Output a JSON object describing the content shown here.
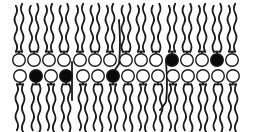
{
  "diagram": {
    "type": "lipid-bilayer",
    "colors": {
      "background": "#ffffff",
      "stroke": "#1a1a1a",
      "head_open": "#ffffff",
      "head_filled": "#0a0a0a"
    },
    "head_radius": 6.3,
    "upper_leaflet": {
      "head_y": 60,
      "tail_direction": "up",
      "tail_length": 50,
      "heads": [
        {
          "x": 19,
          "filled": false
        },
        {
          "x": 34,
          "filled": false
        },
        {
          "x": 49,
          "filled": false
        },
        {
          "x": 64,
          "filled": false
        },
        {
          "x": 80,
          "filled": false
        },
        {
          "x": 95,
          "filled": false
        },
        {
          "x": 110,
          "filled": false
        },
        {
          "x": 126,
          "filled": false
        },
        {
          "x": 141,
          "filled": false
        },
        {
          "x": 156,
          "filled": false
        },
        {
          "x": 172,
          "filled": true
        },
        {
          "x": 187,
          "filled": false
        },
        {
          "x": 202,
          "filled": false
        },
        {
          "x": 217,
          "filled": true
        },
        {
          "x": 232,
          "filled": false
        }
      ]
    },
    "lower_leaflet": {
      "head_y": 76,
      "tail_direction": "down",
      "tail_length": 50,
      "heads": [
        {
          "x": 20,
          "filled": false
        },
        {
          "x": 36,
          "filled": true
        },
        {
          "x": 51,
          "filled": false
        },
        {
          "x": 66,
          "filled": true
        },
        {
          "x": 83,
          "filled": false
        },
        {
          "x": 98,
          "filled": false
        },
        {
          "x": 113,
          "filled": true
        },
        {
          "x": 128,
          "filled": false
        },
        {
          "x": 143,
          "filled": false
        },
        {
          "x": 158,
          "filled": false
        },
        {
          "x": 173,
          "filled": false
        },
        {
          "x": 188,
          "filled": false
        },
        {
          "x": 203,
          "filled": false
        },
        {
          "x": 218,
          "filled": false
        },
        {
          "x": 233,
          "filled": false
        }
      ]
    },
    "inserted_molecules": [
      {
        "kind": "straight-rod",
        "x": 72,
        "y1": 62,
        "y2": 100
      },
      {
        "kind": "hooked-rod",
        "x": 119,
        "y1": 20,
        "y2": 70
      },
      {
        "kind": "hooked-rod",
        "x": 166,
        "y1": 62,
        "y2": 108
      }
    ]
  }
}
